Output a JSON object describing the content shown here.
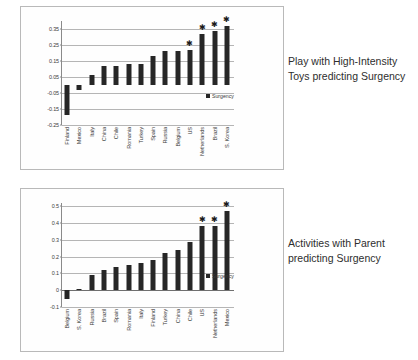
{
  "figures": [
    {
      "caption": "Play with High-Intensity Toys predicting Surgency",
      "legend_label": "Surgency",
      "chart_data": {
        "type": "bar",
        "title": "",
        "xlabel": "",
        "ylabel": "",
        "ylim": [
          -0.25,
          0.4
        ],
        "yticks": [
          "0.35",
          "0.25",
          "0.15",
          "0.05",
          "-0.05",
          "-0.15",
          "-0.25"
        ],
        "ytick_values": [
          0.35,
          0.25,
          0.15,
          0.05,
          -0.05,
          -0.15,
          -0.25
        ],
        "grid": true,
        "legend_position": "right",
        "categories": [
          "Finland",
          "Mexico",
          "Italy",
          "China",
          "Chile",
          "Romania",
          "Turkey",
          "Spain",
          "Russia",
          "Belgium",
          "US",
          "Netherlands",
          "Brazil",
          "S. Korea"
        ],
        "series": [
          {
            "name": "Surgency",
            "values": [
              -0.19,
              -0.03,
              0.06,
              0.12,
              0.12,
              0.13,
              0.13,
              0.18,
              0.21,
              0.21,
              0.22,
              0.32,
              0.34,
              0.37
            ]
          }
        ],
        "annotations": [
          {
            "category": "US",
            "marker": "*"
          },
          {
            "category": "Netherlands",
            "marker": "*"
          },
          {
            "category": "Brazil",
            "marker": "*"
          },
          {
            "category": "S. Korea",
            "marker": "*"
          }
        ]
      }
    },
    {
      "caption": "Activities with Parent predicting Surgency",
      "legend_label": "Surgency",
      "chart_data": {
        "type": "bar",
        "title": "",
        "xlabel": "",
        "ylabel": "",
        "ylim": [
          -0.1,
          0.52
        ],
        "yticks": [
          "0.5",
          "0.4",
          "0.3",
          "0.2",
          "0.1",
          "0",
          "-0.1"
        ],
        "ytick_values": [
          0.5,
          0.4,
          0.3,
          0.2,
          0.1,
          0,
          -0.1
        ],
        "grid": true,
        "legend_position": "right",
        "categories": [
          "Belgium",
          "S. Korea",
          "Russia",
          "Brazil",
          "Spain",
          "Romania",
          "Italy",
          "Finland",
          "Turkey",
          "China",
          "Chile",
          "US",
          "Netherlands",
          "Mexico"
        ],
        "series": [
          {
            "name": "Surgency",
            "values": [
              -0.05,
              0.01,
              0.09,
              0.12,
              0.14,
              0.15,
              0.16,
              0.18,
              0.22,
              0.24,
              0.285,
              0.385,
              0.385,
              0.47
            ]
          }
        ],
        "annotations": [
          {
            "category": "US",
            "marker": "*"
          },
          {
            "category": "Netherlands",
            "marker": "*"
          },
          {
            "category": "Mexico",
            "marker": "*"
          }
        ]
      }
    }
  ]
}
